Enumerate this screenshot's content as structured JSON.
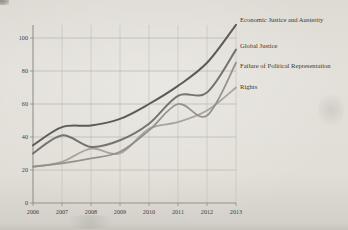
{
  "page": {
    "background_color": "#e1ded7",
    "grid_color": "#c6c3bc",
    "axis_color": "#8e8b84",
    "text_color": "#45423c"
  },
  "chart_data": {
    "type": "line",
    "title": "",
    "xlabel": "",
    "ylabel": "",
    "x": [
      2006,
      2007,
      2008,
      2009,
      2010,
      2011,
      2012,
      2013
    ],
    "xticks": [
      "2006",
      "2007",
      "2008",
      "2009",
      "2010",
      "2011",
      "2012",
      "2013"
    ],
    "yticks": [
      "0",
      "20",
      "40",
      "60",
      "80",
      "100"
    ],
    "ytick_values": [
      0,
      20,
      40,
      60,
      80,
      100
    ],
    "ylim": [
      0,
      110
    ],
    "grid": true,
    "legend_position": "right-edge-labels",
    "series": [
      {
        "name": "Economic Justice and Austerity",
        "values": [
          35,
          46,
          47,
          51,
          60,
          71,
          85,
          108
        ],
        "color": "#504f4b",
        "width": 2
      },
      {
        "name": "Global Justice",
        "values": [
          30,
          41,
          34,
          38,
          48,
          65,
          67,
          93
        ],
        "color": "#6a6964",
        "width": 2
      },
      {
        "name": "Failure of Political Representation",
        "values": [
          22,
          24,
          27,
          31,
          44,
          60,
          53,
          85
        ],
        "color": "#8f8c86",
        "width": 1.8
      },
      {
        "name": "Rights",
        "values": [
          22,
          25,
          33,
          30,
          45,
          49,
          56,
          70
        ],
        "color": "#a39f98",
        "width": 1.8
      }
    ]
  }
}
